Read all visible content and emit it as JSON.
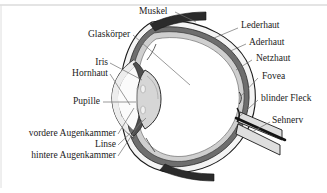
{
  "figure": {
    "language": "de",
    "background_color": "#ffffff",
    "border_color": "#bfbfbf",
    "text_color": "#1a1a1a",
    "leader_color": "#6e6e6e",
    "width": 327,
    "height": 193
  },
  "labels": {
    "muskel": "Muskel",
    "glaskoerper": "Glaskörper",
    "iris": "Iris",
    "hornhaut": "Hornhaut",
    "pupille": "Pupille",
    "vordere_augenkammer": "vordere Augenkammer",
    "linse": "Linse",
    "hintere_augenkammer": "hintere Augenkammer",
    "lederhaut": "Lederhaut",
    "aderhaut": "Aderhaut",
    "netzhaut": "Netzhaut",
    "fovea": "Fovea",
    "blinder_fleck": "blinder Fleck",
    "sehnerv": "Sehnerv"
  },
  "colors": {
    "sclera": "#f2f2f2",
    "choroid": "#6b6b6b",
    "retina": "#c9c9c9",
    "vitreous": "#ffffff",
    "lens": "#d9d9d9",
    "iris_dark": "#5a5a5a",
    "cornea": "#ededed",
    "muscle": "#2b2b2b",
    "optic_nerve": "#dcdcdc",
    "outline": "#1a1a1a"
  }
}
